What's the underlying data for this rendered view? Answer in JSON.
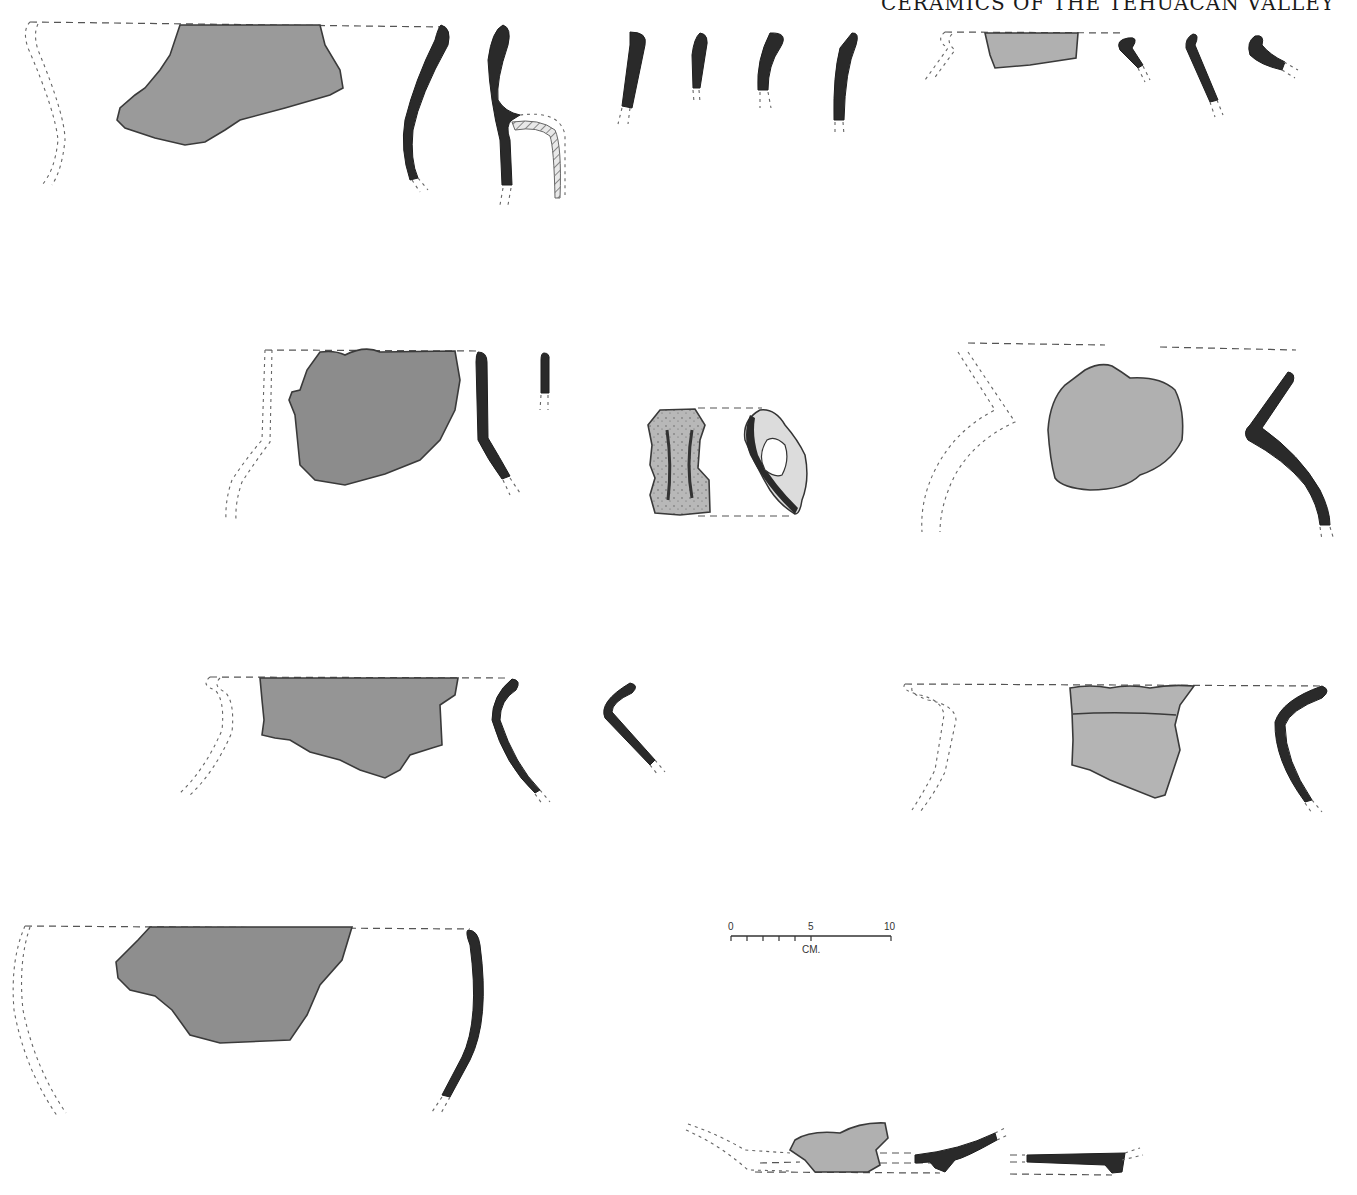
{
  "page": {
    "running_header": "CERAMICS OF THE TEHUACAN VALLEY"
  },
  "scale_bar": {
    "labels": [
      "0",
      "5",
      "10"
    ],
    "unit": "CM.",
    "range_cm": [
      0,
      10
    ],
    "minor_divisions_to_5": 5
  },
  "colors": {
    "sherd_dark": "#8a8a8a",
    "sherd_medium": "#9c9c9c",
    "sherd_light": "#b4b4b4",
    "profile": "#2a2a2a",
    "outline": "#3a3a3a",
    "background": "#ffffff"
  },
  "figures": [
    {
      "id": "row1-jar-large",
      "type": "sherd-with-reconstruction"
    },
    {
      "id": "row1-profile-a",
      "type": "rim-profile"
    },
    {
      "id": "row1-profile-handle",
      "type": "rim-profile-with-handle"
    },
    {
      "id": "row1-profile-small-1",
      "type": "rim-profile"
    },
    {
      "id": "row1-profile-small-2",
      "type": "rim-profile"
    },
    {
      "id": "row1-profile-small-3",
      "type": "rim-profile"
    },
    {
      "id": "row1-profile-small-4",
      "type": "rim-profile"
    },
    {
      "id": "row1-jar-small",
      "type": "sherd-with-reconstruction"
    },
    {
      "id": "row1-profile-everted-1",
      "type": "rim-profile"
    },
    {
      "id": "row1-profile-everted-2",
      "type": "rim-profile"
    },
    {
      "id": "row1-profile-everted-3",
      "type": "rim-profile"
    },
    {
      "id": "row2-jar",
      "type": "sherd-with-reconstruction"
    },
    {
      "id": "row2-handle-lug",
      "type": "handle-view"
    },
    {
      "id": "row2-jar-angled",
      "type": "sherd-with-reconstruction"
    },
    {
      "id": "row3-jar-left",
      "type": "sherd-with-reconstruction"
    },
    {
      "id": "row3-jar-right",
      "type": "sherd-with-reconstruction"
    },
    {
      "id": "row4-bowl",
      "type": "sherd-with-reconstruction"
    },
    {
      "id": "row4-base",
      "type": "base-sherd"
    }
  ]
}
